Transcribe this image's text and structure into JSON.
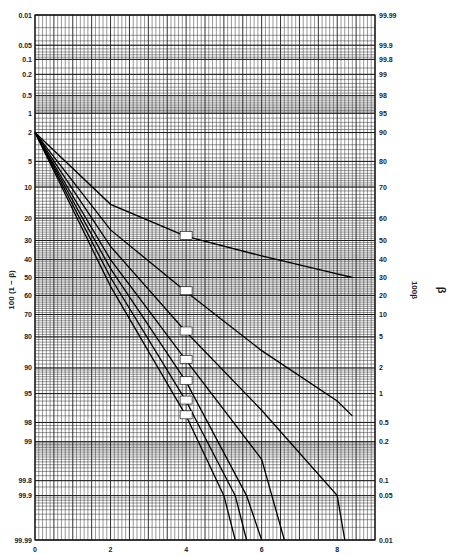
{
  "chart_data": {
    "type": "line",
    "title": "",
    "xlabel": "",
    "ylabel_left": "100 (1 − β)",
    "ylabel_right": "100β",
    "right_side_symbol": "β",
    "xlim": [
      0,
      9
    ],
    "x_ticks": [
      "0",
      "2",
      "4",
      "6",
      "8"
    ],
    "y_scale": "normal-probability",
    "left_ticks": [
      "0.01",
      "0.05",
      "0.1",
      "0.2",
      "0.5",
      "1",
      "2",
      "5",
      "10",
      "20",
      "30",
      "40",
      "50",
      "60",
      "70",
      "80",
      "90",
      "95",
      "98",
      "99",
      "99.8",
      "99.9",
      "99.99"
    ],
    "right_ticks": [
      "99.99",
      "99.9",
      "99.8",
      "99",
      "98",
      "95",
      "90",
      "80",
      "70",
      "60",
      "50",
      "40",
      "30",
      "20",
      "10",
      "5",
      "2",
      "1",
      "0.5",
      "0.2",
      "0.1",
      "0.05",
      "0.01"
    ],
    "grid": true,
    "series": [
      {
        "name": "curve 1",
        "points": [
          [
            0,
            2
          ],
          [
            2,
            15
          ],
          [
            4,
            28
          ],
          [
            6,
            38
          ],
          [
            8,
            48
          ],
          [
            8.4,
            50
          ]
        ]
      },
      {
        "name": "curve 2",
        "points": [
          [
            0,
            2
          ],
          [
            2,
            25
          ],
          [
            4,
            58
          ],
          [
            6,
            85
          ],
          [
            8,
            96
          ],
          [
            8.4,
            97.5
          ]
        ]
      },
      {
        "name": "curve 3",
        "points": [
          [
            0,
            2
          ],
          [
            2,
            33
          ],
          [
            4,
            78
          ],
          [
            6,
            97
          ],
          [
            8,
            99.9
          ],
          [
            8.2,
            99.99
          ]
        ]
      },
      {
        "name": "curve 4",
        "points": [
          [
            0,
            2
          ],
          [
            2,
            40
          ],
          [
            4,
            88
          ],
          [
            6,
            99.5
          ],
          [
            6.6,
            99.99
          ]
        ]
      },
      {
        "name": "curve 5",
        "points": [
          [
            0,
            2
          ],
          [
            2,
            45
          ],
          [
            4,
            93
          ],
          [
            5.6,
            99.9
          ],
          [
            6.0,
            99.99
          ]
        ]
      },
      {
        "name": "curve 6",
        "points": [
          [
            0,
            2
          ],
          [
            2,
            50
          ],
          [
            4,
            96
          ],
          [
            5.3,
            99.9
          ],
          [
            5.6,
            99.99
          ]
        ]
      },
      {
        "name": "curve 7",
        "points": [
          [
            0,
            2
          ],
          [
            2,
            55
          ],
          [
            4,
            97.5
          ],
          [
            5.0,
            99.9
          ],
          [
            5.3,
            99.99
          ]
        ]
      }
    ]
  }
}
